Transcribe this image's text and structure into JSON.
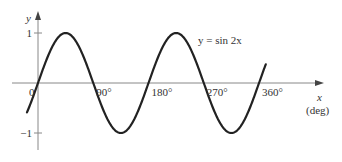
{
  "chart_data": {
    "type": "line",
    "title": "",
    "function_label": "y = sin 2x",
    "xlabel": "x",
    "xunit": "(deg)",
    "ylabel": "y",
    "x_ticks": [
      {
        "value": 0,
        "label": "0"
      },
      {
        "value": 90,
        "label": "90°"
      },
      {
        "value": 180,
        "label": "180°"
      },
      {
        "value": 270,
        "label": "270°"
      },
      {
        "value": 360,
        "label": "360°"
      }
    ],
    "y_ticks": [
      {
        "value": 1,
        "label": "1"
      },
      {
        "value": -1,
        "label": "−1"
      }
    ],
    "xlim": [
      -18,
      371
    ],
    "ylim": [
      -1,
      1
    ],
    "grid": false,
    "legend": "none",
    "series": [
      {
        "name": "y = sin 2x",
        "color": "#222222",
        "x": [
          -18,
          0,
          45,
          90,
          135,
          180,
          225,
          270,
          315,
          360,
          371
        ],
        "values": [
          -0.59,
          0,
          1,
          0,
          -1,
          0,
          1,
          0,
          -1,
          0,
          0.37
        ]
      }
    ]
  },
  "style": {
    "axis_color": "#888888",
    "curve_color": "#222222",
    "text_color": "#333333"
  }
}
